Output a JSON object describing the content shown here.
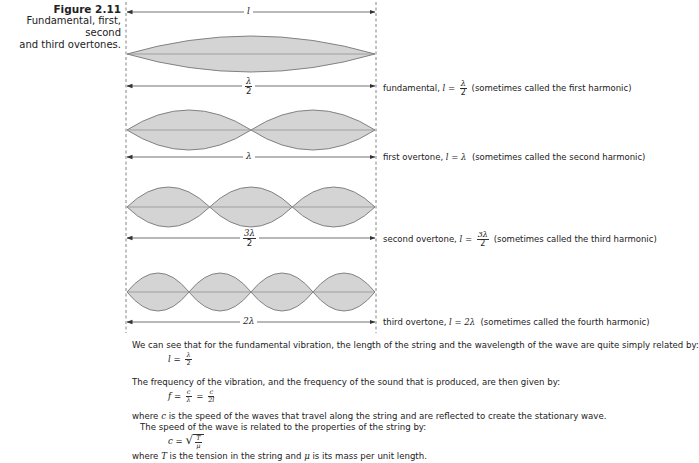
{
  "caption": {
    "figure_number": "Figure 2.11",
    "line1": "Fundamental, first, second",
    "line2": "and third overtones."
  },
  "diagram": {
    "length_label": "l",
    "fill_color": "#d4d4d4",
    "stroke_color": "#777777",
    "modes": [
      {
        "name": "fundamental",
        "loops": 1,
        "dimension_label": {
          "numerator": "λ",
          "denominator": "2"
        },
        "description_prefix": "fundamental, ",
        "equation_lhs": "l",
        "equation_eq": " = ",
        "equation_rhs": {
          "numerator": "λ",
          "denominator": "2"
        },
        "note": "(sometimes called the first harmonic)"
      },
      {
        "name": "first-overtone",
        "loops": 2,
        "dimension_label": "λ",
        "description_prefix": "first overtone, ",
        "equation_lhs": "l",
        "equation_eq": " = ",
        "equation_rhs": "λ",
        "note": "(sometimes called the second harmonic)"
      },
      {
        "name": "second-overtone",
        "loops": 3,
        "dimension_label": {
          "numerator": "3λ",
          "denominator": "2"
        },
        "description_prefix": "second overtone, ",
        "equation_lhs": "l",
        "equation_eq": " = ",
        "equation_rhs": {
          "numerator": "3λ",
          "denominator": "2"
        },
        "note": "(sometimes called the third harmonic)"
      },
      {
        "name": "third-overtone",
        "loops": 4,
        "dimension_label": "2λ",
        "description_prefix": "third overtone, ",
        "equation_lhs": "l",
        "equation_eq": " = ",
        "equation_rhs": "2λ",
        "note": "(sometimes called the fourth harmonic)"
      }
    ]
  },
  "body": {
    "p1": "We can see that for the fundamental vibration, the length of the string and the wavelength of the wave are quite simply related by:",
    "eq1": {
      "lhs": "l",
      "eq": " = ",
      "num": "λ",
      "den": "2"
    },
    "p2": "The frequency of the vibration, and the frequency of the sound that is produced, are then given by:",
    "eq2": {
      "lhs": "f",
      "eq": " = ",
      "num1": "c",
      "den1": "λ",
      "eq_b": " = ",
      "num2": "c",
      "den2": "2l"
    },
    "p3_pre": "where ",
    "p3_var": "c",
    "p3_post": " is the speed of the waves that travel along the string and are reflected to create the stationary wave.",
    "p4": "The speed of the wave is related to the properties of the string by:",
    "eq3": {
      "lhs": "c",
      "eq": " = ",
      "num": "T",
      "den": "μ"
    },
    "p5_pre": "where ",
    "p5_var1": "T",
    "p5_mid": " is the tension in the string and ",
    "p5_var2": "μ",
    "p5_post": " is its mass per unit length."
  }
}
